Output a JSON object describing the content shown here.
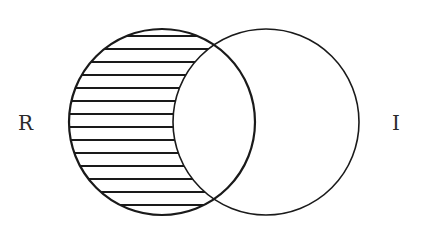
{
  "diagram": {
    "type": "venn",
    "sets": [
      {
        "id": "R",
        "label": "R",
        "cx": 162,
        "cy": 122,
        "r": 93
      },
      {
        "id": "I",
        "label": "I",
        "cx": 266,
        "cy": 122,
        "r": 93
      }
    ],
    "shaded_region": "R minus I",
    "hatch": {
      "style": "horizontal",
      "spacing": 13,
      "y_start": 36,
      "y_end": 212
    },
    "colors": {
      "stroke": "#1a1a1a",
      "hatch": "#1a1a1a",
      "background": "#ffffff",
      "label": "#2a2a2a"
    }
  },
  "labels": {
    "left": "R",
    "right": "I"
  }
}
